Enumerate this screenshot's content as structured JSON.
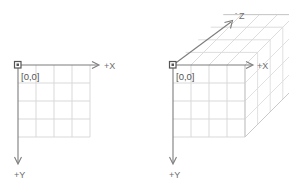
{
  "figure": {
    "colors": {
      "background": "#ffffff",
      "axis": "#7d7d7d",
      "grid": "#d9d9d9",
      "grid_faint": "#e4e4e4",
      "text": "#6e6e6e",
      "origin_marker": "#555555"
    }
  },
  "diagrams": [
    {
      "id": "diagram-2d",
      "name": "2d-coordinate-system",
      "origin_label": "[0,0]",
      "axes": [
        {
          "id": "x",
          "label": "+X",
          "direction": "right"
        },
        {
          "id": "y",
          "label": "+Y",
          "direction": "down"
        }
      ],
      "grid": {
        "cols": 4,
        "rows": 4
      }
    },
    {
      "id": "diagram-3d",
      "name": "3d-coordinate-system",
      "origin_label": "[0,0]",
      "axes": [
        {
          "id": "x",
          "label": "+X",
          "direction": "right"
        },
        {
          "id": "y",
          "label": "+Y",
          "direction": "down"
        },
        {
          "id": "z",
          "label": "-Z",
          "label_sign": "-",
          "label_letter": "Z",
          "direction": "up-right-diagonal"
        }
      ],
      "grid": {
        "cols": 4,
        "rows": 4,
        "depth": 4
      },
      "shape": "cube"
    }
  ]
}
